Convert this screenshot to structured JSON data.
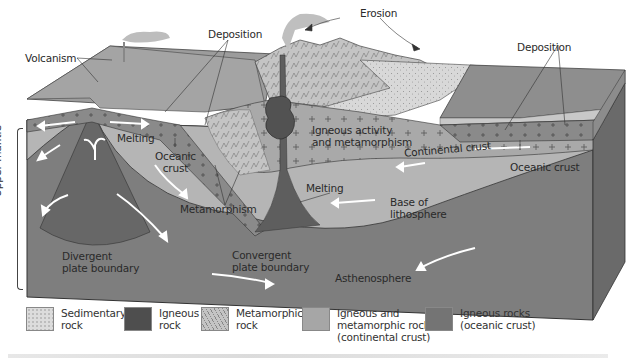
{
  "diagram": {
    "labels": {
      "volcanism": "Volcanism",
      "deposition_left": "Deposition",
      "erosion": "Erosion",
      "deposition_right": "Deposition",
      "melting_left": "Melting",
      "oceanic_crust_left": [
        "Oceanic",
        "crust"
      ],
      "igneous_activity": [
        "Igneous activity",
        "and metamorphism"
      ],
      "continental_crust": "Continental crust",
      "oceanic_crust_right": "Oceanic crust",
      "metamorphism": "Metamorphism",
      "melting_center": "Melting",
      "base_of_lithosphere": [
        "Base of",
        "lithosphere"
      ],
      "upper_mantle": "Upper mantle",
      "divergent": [
        "Divergent",
        "plate boundary"
      ],
      "convergent": [
        "Convergent",
        "plate boundary"
      ],
      "asthenosphere": "Asthenosphere"
    },
    "colors": {
      "asthenosphere": "#7d7d7d",
      "lithosphere": "#b4b4b4",
      "oceanic_crust": "#8e8e8e",
      "continental_crust": "#a8a8a8",
      "sedimentary": "#d6d6d6",
      "surface_top": "#9a9a9a",
      "side_face": "#6c6c6c",
      "igneous": "#5a5a5a",
      "arrow": "#ffffff"
    }
  },
  "legend": [
    {
      "name": "sedimentary",
      "line1": "Sedimentary",
      "line2": "rock",
      "line3": "",
      "color": "#dcdcdc"
    },
    {
      "name": "igneous",
      "line1": "Igneous",
      "line2": "rock",
      "line3": "",
      "color": "#4e4e4e"
    },
    {
      "name": "metamorphic",
      "line1": "Metamorphic",
      "line2": "rock",
      "line3": "",
      "color": "#c4c4c4"
    },
    {
      "name": "igneous-metamorphic",
      "line1": "Igneous and",
      "line2": "metamorphic rock",
      "line3": "(continental crust)",
      "color": "#a6a6a6"
    },
    {
      "name": "igneous-oceanic",
      "line1": "Igneous rocks",
      "line2": "(oceanic crust)",
      "line3": "",
      "color": "#747474"
    }
  ]
}
